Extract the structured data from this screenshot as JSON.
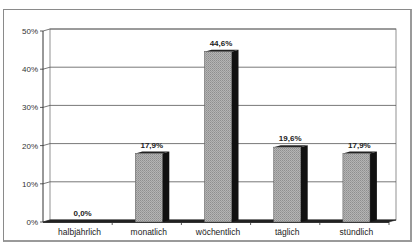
{
  "chart_data": {
    "type": "bar",
    "title": "",
    "xlabel": "",
    "ylabel": "",
    "categories": [
      "halbjährlich",
      "monatlich",
      "wöchentlich",
      "täglich",
      "stündlich"
    ],
    "values": [
      0.0,
      17.9,
      44.6,
      19.6,
      17.9
    ],
    "value_labels": [
      "0,0%",
      "17,9%",
      "44,6%",
      "19,6%",
      "17,9%"
    ],
    "ylim": [
      0,
      50
    ],
    "yticks": [
      0,
      10,
      20,
      30,
      40,
      50
    ],
    "ytick_labels": [
      "0%",
      "10%",
      "20%",
      "30%",
      "40%",
      "50%"
    ],
    "grid": true,
    "legend": "none",
    "style": "3d-bar",
    "colors": {
      "bar_front": "#a8a8a8",
      "bar_side": "#111111",
      "grid": "#555555",
      "frame": "#8a8a8a"
    }
  }
}
